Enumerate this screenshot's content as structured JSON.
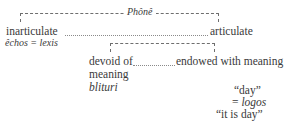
{
  "diagram": {
    "type": "tree",
    "apex": {
      "label": "Phônê",
      "style": "italic"
    },
    "level1": {
      "left": {
        "label": "inarticulate",
        "gloss": "êchos = lexis"
      },
      "right": {
        "label": "articulate"
      }
    },
    "level2": {
      "left": {
        "label_line1": "devoid of",
        "label_line2": "meaning",
        "example": "blituri"
      },
      "right": {
        "label": "endowed with meaning",
        "example_line1": "“day”",
        "example_line2": "= logos",
        "example_line3": "“it is day”"
      }
    },
    "colors": {
      "text": "#3a3a3a",
      "rule": "#6e6e6e",
      "leader": "#8a8a8a",
      "background": "#ffffff"
    }
  }
}
